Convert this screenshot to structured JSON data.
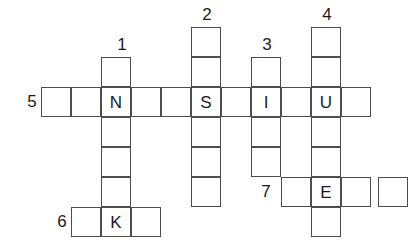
{
  "puzzle": {
    "title": "Crossword grid",
    "grid": {
      "cell_size": 30,
      "origin_x": 45,
      "origin_y": 27,
      "columns": 12,
      "rows": 7,
      "line_color": "#4d4d4d",
      "background": "#ffffff",
      "text_color": "#1a1a1a"
    },
    "clue_numbers": [
      {
        "label": "1",
        "x": 112,
        "y": 36,
        "orientation": "down"
      },
      {
        "label": "2",
        "x": 197,
        "y": 6,
        "orientation": "down"
      },
      {
        "label": "3",
        "x": 257,
        "y": 36,
        "orientation": "down"
      },
      {
        "label": "4",
        "x": 317,
        "y": 6,
        "orientation": "down"
      },
      {
        "label": "5",
        "x": 22,
        "y": 93,
        "orientation": "across"
      },
      {
        "label": "6",
        "x": 52,
        "y": 213,
        "orientation": "across"
      },
      {
        "label": "7",
        "x": 256,
        "y": 183,
        "orientation": "across"
      }
    ],
    "entries": [
      {
        "number": "1",
        "orientation": "down",
        "start": {
          "col": 2,
          "row": 1
        },
        "length": 5,
        "letters": [
          "",
          "N",
          "",
          "",
          "K"
        ]
      },
      {
        "number": "2",
        "orientation": "down",
        "start": {
          "col": 5,
          "row": 0
        },
        "length": 6,
        "letters": [
          "",
          "",
          "S",
          "",
          "",
          ""
        ]
      },
      {
        "number": "3",
        "orientation": "down",
        "start": {
          "col": 7,
          "row": 1
        },
        "length": 4,
        "letters": [
          "",
          "I",
          "",
          ""
        ]
      },
      {
        "number": "4",
        "orientation": "down",
        "start": {
          "col": 9,
          "row": 0
        },
        "length": 6,
        "letters": [
          "",
          "",
          "U",
          "",
          "E",
          ""
        ]
      },
      {
        "number": "5",
        "orientation": "across",
        "start": {
          "col": 0,
          "row": 2
        },
        "length": 11,
        "letters": [
          "",
          "",
          "N",
          "",
          "",
          "S",
          "",
          "I",
          "",
          "U",
          ""
        ]
      },
      {
        "number": "6",
        "orientation": "across",
        "start": {
          "col": 1,
          "row": 6
        },
        "length": 3,
        "letters": [
          "",
          "K",
          ""
        ]
      },
      {
        "number": "7",
        "orientation": "across",
        "start": {
          "col": 8,
          "row": 5
        },
        "length": 4,
        "letters": [
          "",
          "E",
          "",
          ""
        ]
      }
    ],
    "cells": [
      {
        "name": "cell-c2r1",
        "x": 101,
        "y": 57,
        "letter": ""
      },
      {
        "name": "cell-c2r2",
        "x": 101,
        "y": 87,
        "letter": "N"
      },
      {
        "name": "cell-c2r3",
        "x": 101,
        "y": 117,
        "letter": ""
      },
      {
        "name": "cell-c2r4",
        "x": 101,
        "y": 147,
        "letter": ""
      },
      {
        "name": "cell-c2r5",
        "x": 101,
        "y": 177,
        "letter": ""
      },
      {
        "name": "cell-c2r6",
        "x": 101,
        "y": 207,
        "letter": "K"
      },
      {
        "name": "cell-c5r0",
        "x": 191,
        "y": 27,
        "letter": ""
      },
      {
        "name": "cell-c5r1",
        "x": 191,
        "y": 57,
        "letter": ""
      },
      {
        "name": "cell-c5r2",
        "x": 191,
        "y": 87,
        "letter": "S"
      },
      {
        "name": "cell-c5r3",
        "x": 191,
        "y": 117,
        "letter": ""
      },
      {
        "name": "cell-c5r4",
        "x": 191,
        "y": 147,
        "letter": ""
      },
      {
        "name": "cell-c5r5",
        "x": 191,
        "y": 177,
        "letter": ""
      },
      {
        "name": "cell-c7r1",
        "x": 251,
        "y": 57,
        "letter": ""
      },
      {
        "name": "cell-c7r2",
        "x": 251,
        "y": 87,
        "letter": "I"
      },
      {
        "name": "cell-c7r3",
        "x": 251,
        "y": 117,
        "letter": ""
      },
      {
        "name": "cell-c7r4",
        "x": 251,
        "y": 147,
        "letter": ""
      },
      {
        "name": "cell-c9r0",
        "x": 311,
        "y": 27,
        "letter": ""
      },
      {
        "name": "cell-c9r1",
        "x": 311,
        "y": 57,
        "letter": ""
      },
      {
        "name": "cell-c9r2",
        "x": 311,
        "y": 87,
        "letter": "U"
      },
      {
        "name": "cell-c9r3",
        "x": 311,
        "y": 117,
        "letter": ""
      },
      {
        "name": "cell-c9r4",
        "x": 311,
        "y": 147,
        "letter": ""
      },
      {
        "name": "cell-c9r5",
        "x": 311,
        "y": 177,
        "letter": "E"
      },
      {
        "name": "cell-c9r6",
        "x": 311,
        "y": 207,
        "letter": ""
      },
      {
        "name": "cell-c0r2",
        "x": 41,
        "y": 87,
        "letter": ""
      },
      {
        "name": "cell-c1r2",
        "x": 71,
        "y": 87,
        "letter": ""
      },
      {
        "name": "cell-c3r2",
        "x": 131,
        "y": 87,
        "letter": ""
      },
      {
        "name": "cell-c4r2",
        "x": 161,
        "y": 87,
        "letter": ""
      },
      {
        "name": "cell-c6r2",
        "x": 221,
        "y": 87,
        "letter": ""
      },
      {
        "name": "cell-c8r2",
        "x": 281,
        "y": 87,
        "letter": ""
      },
      {
        "name": "cell-c10r2",
        "x": 341,
        "y": 87,
        "letter": ""
      },
      {
        "name": "cell-c1r6",
        "x": 71,
        "y": 207,
        "letter": ""
      },
      {
        "name": "cell-c3r6",
        "x": 131,
        "y": 207,
        "letter": ""
      },
      {
        "name": "cell-c8r5",
        "x": 281,
        "y": 177,
        "letter": ""
      },
      {
        "name": "cell-c10r5",
        "x": 341,
        "y": 177,
        "letter": ""
      },
      {
        "name": "cell-c11r5",
        "x": 378,
        "y": 177,
        "letter": ""
      }
    ]
  }
}
